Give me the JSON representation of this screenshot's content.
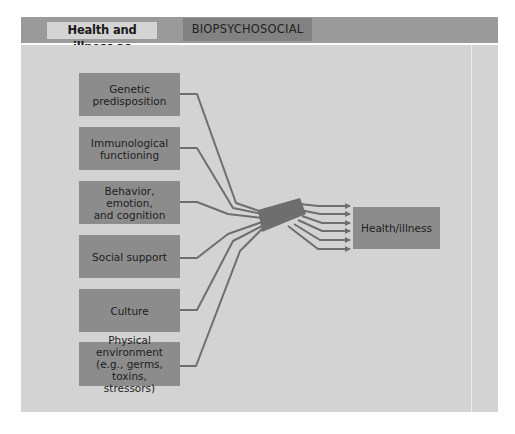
{
  "header": {
    "label": "Health and illness as",
    "tag": "BIOPSYCHOSOCIAL"
  },
  "diagram": {
    "factors": [
      {
        "label": "Genetic\npredisposition"
      },
      {
        "label": "Immunological\nfunctioning"
      },
      {
        "label": "Behavior, emotion,\nand cognition"
      },
      {
        "label": "Social support"
      },
      {
        "label": "Culture"
      },
      {
        "label": "Physical environment\n(e.g., germs, toxins,\nstressors)"
      }
    ],
    "outcome": {
      "label": "Health/illness"
    },
    "colors": {
      "header_bar": "#9a9a9a",
      "panel": "#d3d3d3",
      "box": "#8c8c8c",
      "line": "#6e6e6e"
    }
  }
}
